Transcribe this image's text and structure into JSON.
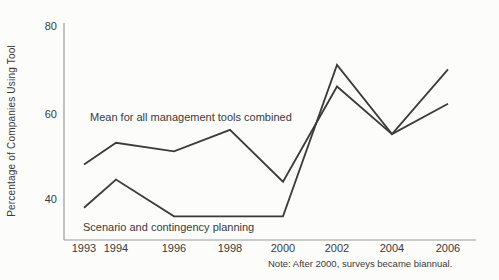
{
  "chart_data": {
    "type": "line",
    "title": "",
    "x_labels": [
      "1993",
      "1994",
      "1996",
      "1998",
      "2000",
      "2002",
      "2004",
      "2006"
    ],
    "ylabel": "Percentage of Companies Using Tool",
    "yticks_top_to_bottom": [
      "80",
      "60",
      "40"
    ],
    "ylim": [
      30,
      82
    ],
    "grid": false,
    "legend": "inline-annotations",
    "series": [
      {
        "name": "Mean for all management tools combined",
        "values": [
          48,
          53,
          51,
          56,
          44,
          66,
          55,
          62
        ],
        "color": "#3b3b3b"
      },
      {
        "name": "Scenario and contingency planning",
        "values": [
          38,
          44.5,
          36,
          36,
          36,
          71,
          55,
          70
        ],
        "color": "#3b3b3b"
      }
    ],
    "note": "Note: After 2000, surveys became biannual."
  }
}
